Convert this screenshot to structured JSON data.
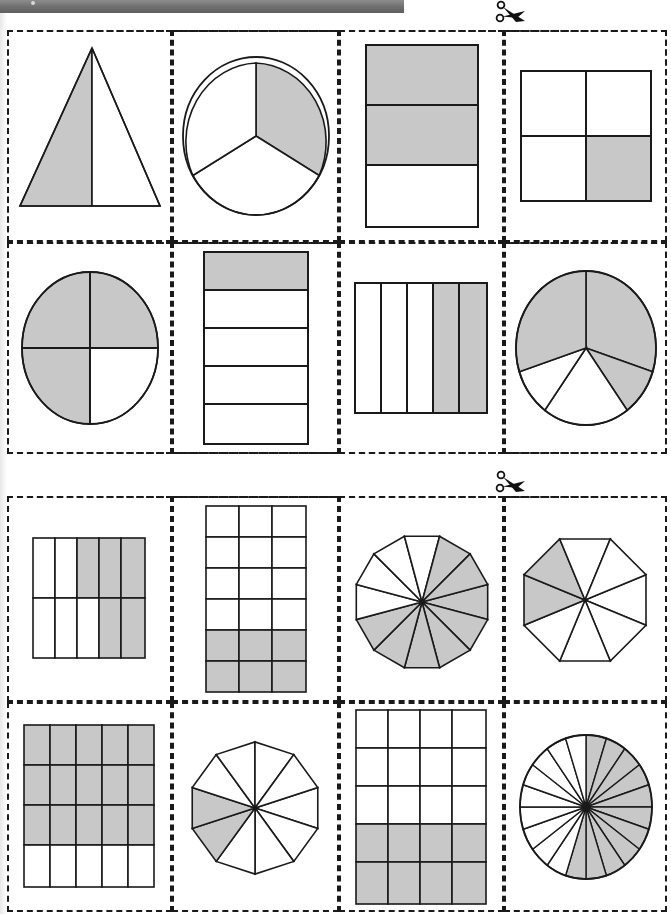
{
  "document": {
    "title": "Fraction shapes cut-out worksheet",
    "page_width": 671,
    "page_height": 914
  },
  "colors": {
    "shade": "#c8c8c8",
    "stroke": "#1a1a1a",
    "background": "#ffffff",
    "toolbar": "#6e6e6e"
  },
  "cut_markers": [
    {
      "name": "scissors-top",
      "x": 490,
      "y": 2
    },
    {
      "name": "scissors-middle",
      "x": 490,
      "y": 470
    }
  ],
  "sections": [
    {
      "name": "section-1",
      "x": 7,
      "y": 30,
      "width": 660,
      "height": 212,
      "cards": [
        {
          "id": "r1c1",
          "shape": "triangle",
          "parts": 2,
          "shaded": 1,
          "fraction": "1/2",
          "label": "triangle-halves"
        },
        {
          "id": "r1c2",
          "shape": "circle",
          "parts": 3,
          "shaded": 1,
          "fraction": "1/3",
          "label": "circle-thirds"
        },
        {
          "id": "r1c3",
          "shape": "rectangle-rows",
          "parts": 3,
          "shaded": 2,
          "fraction": "2/3",
          "label": "rectangle-thirds"
        },
        {
          "id": "r1c4",
          "shape": "grid",
          "cols": 2,
          "rows": 2,
          "parts": 4,
          "shaded": 1,
          "fraction": "1/4",
          "label": "square-quarters"
        }
      ]
    },
    {
      "name": "section-2",
      "x": 7,
      "y": 242,
      "width": 660,
      "height": 212,
      "cards": [
        {
          "id": "r2c1",
          "shape": "circle",
          "parts": 4,
          "shaded": 3,
          "fraction": "3/4",
          "label": "circle-quarters"
        },
        {
          "id": "r2c2",
          "shape": "rectangle-rows",
          "parts": 5,
          "shaded": 1,
          "fraction": "1/5",
          "label": "rectangle-fifths-rows"
        },
        {
          "id": "r2c3",
          "shape": "rectangle-cols",
          "parts": 5,
          "shaded": 2,
          "fraction": "2/5",
          "label": "rectangle-fifths-cols"
        },
        {
          "id": "r2c4",
          "shape": "circle",
          "parts": 5,
          "shaded": 3,
          "fraction": "3/5",
          "label": "circle-fifths"
        }
      ]
    },
    {
      "name": "section-3",
      "x": 7,
      "y": 496,
      "width": 660,
      "height": 206,
      "cards": [
        {
          "id": "r3c1",
          "shape": "grid",
          "cols": 5,
          "rows": 2,
          "parts": 10,
          "shaded": 5,
          "fraction": "5/10",
          "label": "grid-5x2"
        },
        {
          "id": "r3c2",
          "shape": "grid",
          "cols": 3,
          "rows": 6,
          "parts": 18,
          "shaded": 6,
          "fraction": "6/18",
          "label": "grid-3x6"
        },
        {
          "id": "r3c3",
          "shape": "polygon",
          "sides": 12,
          "parts": 12,
          "shaded": 8,
          "fraction": "8/12",
          "label": "dodecagon-twelfths"
        },
        {
          "id": "r3c4",
          "shape": "polygon",
          "sides": 8,
          "parts": 8,
          "shaded": 2,
          "fraction": "2/8",
          "label": "octagon-eighths"
        }
      ]
    },
    {
      "name": "section-4",
      "x": 7,
      "y": 702,
      "width": 660,
      "height": 210,
      "cards": [
        {
          "id": "r4c1",
          "shape": "grid",
          "cols": 5,
          "rows": 4,
          "parts": 20,
          "shaded": 15,
          "fraction": "15/20",
          "label": "grid-5x4"
        },
        {
          "id": "r4c2",
          "shape": "polygon",
          "sides": 10,
          "parts": 10,
          "shaded": 2,
          "fraction": "2/10",
          "label": "decagon-tenths"
        },
        {
          "id": "r4c3",
          "shape": "grid",
          "cols": 4,
          "rows": 5,
          "parts": 20,
          "shaded": 8,
          "fraction": "8/20",
          "label": "grid-4x5"
        },
        {
          "id": "r4c4",
          "shape": "circle",
          "parts": 20,
          "shaded": 11,
          "fraction": "11/20",
          "label": "circle-twentieths"
        }
      ]
    }
  ]
}
